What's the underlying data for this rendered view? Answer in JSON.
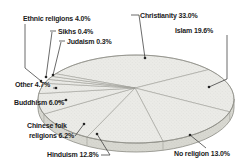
{
  "chart_data": {
    "type": "pie",
    "style": "3d-perspective",
    "title": "",
    "unit": "%",
    "total": 100.0,
    "legend": "none",
    "layout": "labels-outside-with-leader-lines",
    "slices": [
      {
        "label": "Christianity",
        "value": 33.0,
        "display": "Christianity 33.0%"
      },
      {
        "label": "Islam",
        "value": 19.6,
        "display": "Islam 19.6%"
      },
      {
        "label": "No religion",
        "value": 13.0,
        "display": "No religion 13.0%"
      },
      {
        "label": "Hinduism",
        "value": 12.8,
        "display": "Hinduism 12.8%"
      },
      {
        "label": "Chinese folk religions",
        "value": 6.2,
        "display": "Chinese folk religions 6.2%",
        "line1": "Chinese folk",
        "line2": "religions 6.2%"
      },
      {
        "label": "Buddhism",
        "value": 6.0,
        "display": "Buddhism 6.0%"
      },
      {
        "label": "Other",
        "value": 4.7,
        "display": "Other 4.7%"
      },
      {
        "label": "Ethnic religions",
        "value": 4.0,
        "display": "Ethnic religions 4.0%"
      },
      {
        "label": "Sikhs",
        "value": 0.4,
        "display": "Sikhs 0.4%"
      },
      {
        "label": "Judaism",
        "value": 0.3,
        "display": "Judaism 0.3%"
      }
    ],
    "colors": {
      "background": "#ffffff",
      "pie_top": "#ececе8",
      "pie_top_fill": "#ececf0",
      "top_surface": "#ebebe7",
      "side_surface": "#d8d8d1",
      "slice_line": "#a0a099",
      "outline": "#8b8b84",
      "leader_line": "#3a3a3a",
      "dot": "#242424",
      "text": "#1b1b1b"
    }
  }
}
